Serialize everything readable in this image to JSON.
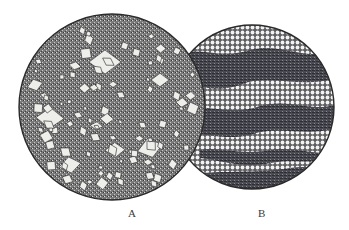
{
  "figure": {
    "panels": [
      {
        "id": "A",
        "label": "A",
        "description": "Microscope field showing large rhombic/rectangular crystals scattered in a fine-grained dark groundmass",
        "center": [
          112,
          107
        ],
        "radius": 93
      },
      {
        "id": "B",
        "label": "B",
        "description": "Microscope field showing banded texture: layers of small round light grains alternating with dark streaky bands",
        "center": [
          252,
          107
        ],
        "radius": 82
      }
    ],
    "colors": {
      "background": "#ffffff",
      "outline": "#2b2b2b",
      "groundmass": "#6a6a6a",
      "crystal": "#eeeeea",
      "dark_band": "#4a4a52",
      "grain": "#f2f2f0"
    }
  }
}
